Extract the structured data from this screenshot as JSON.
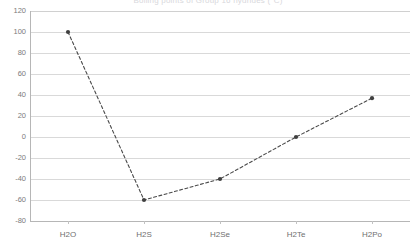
{
  "chart_data": {
    "type": "line",
    "title": "Boiling points of Group 16 hydrides (°C)",
    "subtitle": "",
    "xlabel": "",
    "ylabel": "",
    "categories": [
      "H2O",
      "H2S",
      "H2Se",
      "H2Te",
      "H2Po"
    ],
    "values": [
      100,
      -60,
      -40,
      0,
      37
    ],
    "series": [
      {
        "name": "Boiling point",
        "values": [
          100,
          -60,
          -40,
          0,
          37
        ]
      }
    ],
    "ylim": [
      -80,
      120
    ],
    "yticks": [
      120,
      100,
      80,
      60,
      40,
      20,
      0,
      -20,
      -40,
      -60,
      -80
    ],
    "ytick_labels": [
      "120",
      "100",
      "80",
      "60",
      "40",
      "20",
      "0",
      "-20",
      "-40",
      "-60",
      "-80"
    ],
    "grid": "horizontal",
    "legend": "none",
    "marker": "circle",
    "line_style": "dashed",
    "line_color": "#4a4a4a",
    "marker_color": "#3f3f3f",
    "gridline_color": "#d9d9d9",
    "axis_color": "#b6b6b6",
    "tick_label_color": "#7b7b7b",
    "background": "#ffffff",
    "annotations": []
  },
  "axis": {
    "y_tick_labels": [
      "120",
      "100",
      "80",
      "60",
      "40",
      "20",
      "0",
      "-20",
      "-40",
      "-60",
      "-80"
    ],
    "x_tick_labels": [
      "H2O",
      "H2S",
      "H2Se",
      "H2Te",
      "H2Po"
    ]
  }
}
